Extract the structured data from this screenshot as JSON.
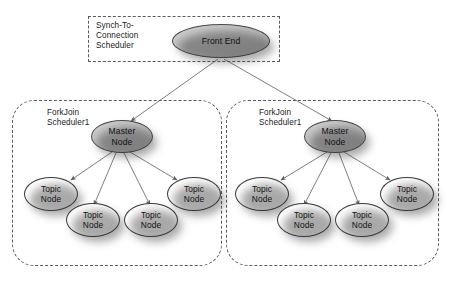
{
  "diagram": {
    "colors": {
      "background": "#ffffff",
      "node_gray_fill": "#c6c6c6",
      "node_white_fill": "#ffffff",
      "node_border": "#4a4a4a",
      "dashed_border": "#5a5a5a",
      "edge": "#6f6f6f",
      "text": "#111111"
    },
    "groups": [
      {
        "id": "synch-to-connection-scheduler",
        "label": "Synch-To-\nConnection\nScheduler",
        "corner_style": "sharp"
      },
      {
        "id": "forkjoin-scheduler-left",
        "label": "ForkJoin\nScheduler1",
        "corner_style": "rounded"
      },
      {
        "id": "forkjoin-scheduler-right",
        "label": "ForkJoin\nScheduler1",
        "corner_style": "rounded"
      }
    ],
    "nodes": {
      "front_end": {
        "label": "Front End",
        "fill": "gray"
      },
      "master_node": {
        "label": "Master\nNode",
        "fill": "gray"
      },
      "topic_node": {
        "label": "Topic\nNode",
        "fill": "white"
      }
    },
    "left_cluster": {
      "master": {
        "label": "Master\nNode"
      },
      "topics": [
        {
          "label": "Topic\nNode"
        },
        {
          "label": "Topic\nNode"
        },
        {
          "label": "Topic\nNode"
        },
        {
          "label": "Topic\nNode"
        }
      ]
    },
    "right_cluster": {
      "master": {
        "label": "Master\nNode"
      },
      "topics": [
        {
          "label": "Topic\nNode"
        },
        {
          "label": "Topic\nNode"
        },
        {
          "label": "Topic\nNode"
        },
        {
          "label": "Topic\nNode"
        }
      ]
    },
    "edge_count": 10
  }
}
